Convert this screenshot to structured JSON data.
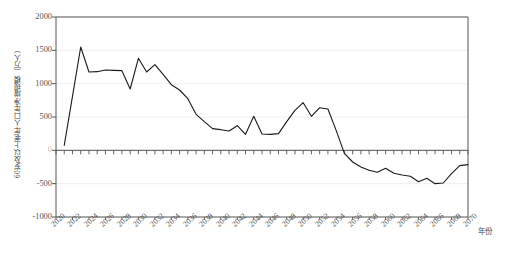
{
  "chart_data": {
    "type": "line",
    "title": "",
    "subtitle": "",
    "xlabel": "年份",
    "ylabel": "60岁及以上老年人口年净增规模（万人）",
    "xlim": [
      2020,
      2070
    ],
    "ylim": [
      -1000,
      2000
    ],
    "ytick_values": [
      2000,
      1500,
      1000,
      500,
      0,
      -500,
      -1000
    ],
    "ytick_labels": [
      "2000",
      "1500",
      "1000",
      "500",
      "0",
      "-500",
      "-1000"
    ],
    "xtick_labels": [
      "2020",
      "2022",
      "2024",
      "2026",
      "2028",
      "2030",
      "2032",
      "2034",
      "2036",
      "2038",
      "2040",
      "2042",
      "2044",
      "2046",
      "2048",
      "2050",
      "2052",
      "2054",
      "2056",
      "2058",
      "2060",
      "2062",
      "2064",
      "2066",
      "2068",
      "2070"
    ],
    "grid": true,
    "grid_axis": "y",
    "legend": "none",
    "line_color": "#1a1a1a",
    "line_width": 1.1,
    "markers": false,
    "x": [
      2021,
      2022,
      2023,
      2024,
      2025,
      2026,
      2027,
      2028,
      2029,
      2030,
      2031,
      2032,
      2033,
      2034,
      2035,
      2036,
      2037,
      2038,
      2039,
      2040,
      2041,
      2042,
      2043,
      2044,
      2045,
      2046,
      2047,
      2048,
      2049,
      2050,
      2051,
      2052,
      2053,
      2054,
      2055,
      2056,
      2057,
      2058,
      2059,
      2060,
      2061,
      2062,
      2063,
      2064,
      2065,
      2066,
      2067,
      2068,
      2069,
      2070
    ],
    "values": [
      75,
      810,
      1550,
      1175,
      1180,
      1205,
      1200,
      1195,
      920,
      1380,
      1175,
      1285,
      1140,
      985,
      905,
      775,
      540,
      430,
      325,
      310,
      290,
      370,
      240,
      510,
      245,
      240,
      250,
      430,
      600,
      715,
      510,
      640,
      620,
      300,
      -45,
      -175,
      -250,
      -300,
      -330,
      -270,
      -345,
      -370,
      -390,
      -470,
      -420,
      -500,
      -490,
      -350,
      -230,
      -215
    ]
  },
  "axes": {
    "y_label_color": "#4a4a4a",
    "x_label_color": "#4a4a4a",
    "frame_color": "#555555",
    "grid_color": "#e8e8e8"
  }
}
